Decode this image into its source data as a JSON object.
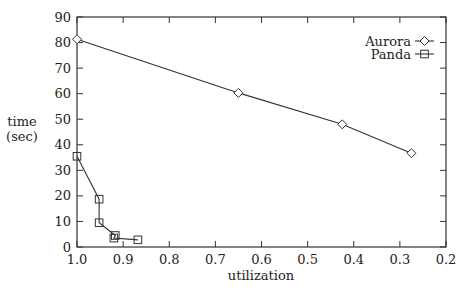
{
  "chart_data": {
    "type": "line",
    "title": "",
    "xlabel": "utilization",
    "ylabel": "time\n(sec)",
    "ylabel_lines": [
      "time",
      "(sec)"
    ],
    "xlim": [
      1.0,
      0.2
    ],
    "ylim": [
      0,
      90
    ],
    "x_reversed": true,
    "xticks": [
      1.0,
      0.9,
      0.8,
      0.7,
      0.6,
      0.5,
      0.4,
      0.3,
      0.2
    ],
    "xtick_labels": [
      "1.0",
      "0.9",
      "0.8",
      "0.7",
      "0.6",
      "0.5",
      "0.4",
      "0.3",
      "0.2"
    ],
    "yticks": [
      0,
      10,
      20,
      30,
      40,
      50,
      60,
      70,
      80,
      90
    ],
    "ytick_labels": [
      "0",
      "10",
      "20",
      "30",
      "40",
      "50",
      "60",
      "70",
      "80",
      "90"
    ],
    "grid": false,
    "legend_position": "upper right",
    "series": [
      {
        "name": "Aurora",
        "marker": "diamond",
        "x": [
          1.0,
          0.65,
          0.425,
          0.275
        ],
        "y": [
          81.3,
          60.3,
          48.0,
          36.7
        ]
      },
      {
        "name": "Panda",
        "marker": "square",
        "x": [
          1.0,
          0.952,
          0.952,
          0.917,
          0.92,
          0.868
        ],
        "y": [
          35.5,
          18.7,
          9.5,
          4.5,
          3.5,
          2.8
        ]
      }
    ]
  },
  "legend": {
    "items": [
      {
        "label": "Aurora",
        "marker": "diamond-icon"
      },
      {
        "label": "Panda",
        "marker": "square-icon"
      }
    ]
  },
  "style": {
    "line_color": "#333333",
    "axis_color": "#333333",
    "background": "#ffffff"
  }
}
